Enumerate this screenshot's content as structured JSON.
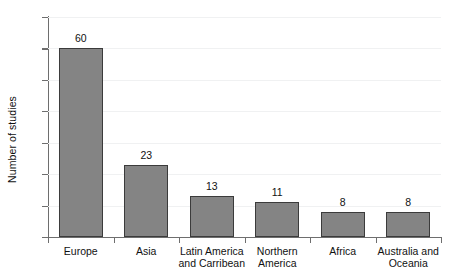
{
  "chart_data": {
    "type": "bar",
    "title": "",
    "xlabel": "",
    "ylabel": "Number of studies",
    "categories": [
      "Europe",
      "Latin America and Carribean",
      "Asia",
      "Northern America",
      "Africa",
      "Australia and Oceania"
    ],
    "category_lines": [
      [
        "Europe"
      ],
      [
        "Asia"
      ],
      [
        "Latin America",
        "and Carribean"
      ],
      [
        "Northern",
        "America"
      ],
      [
        "Africa"
      ],
      [
        "Australia and",
        "Oceania"
      ]
    ],
    "categories_ordered": [
      "Europe",
      "Asia",
      "Latin America and Carribean",
      "Northern America",
      "Africa",
      "Australia and Oceania"
    ],
    "values": [
      60,
      23,
      13,
      11,
      8,
      8
    ],
    "value_labels": [
      "60",
      "23",
      "13",
      "11",
      "8",
      "8"
    ],
    "ylim": [
      0,
      70
    ],
    "yticks": [
      0,
      10,
      20,
      30,
      40,
      50,
      60,
      70
    ],
    "ytick_labels": [
      "0",
      "10",
      "20",
      "30",
      "40",
      "50",
      "60",
      "70"
    ],
    "grid": true,
    "grid_axis": "y",
    "legend": null,
    "bar_color": "#848484",
    "bar_edge_color": "#3b3b3b",
    "gridline_color": "#f0f1f2",
    "axis_color": "#6e6e6e",
    "background": "#ffffff"
  }
}
